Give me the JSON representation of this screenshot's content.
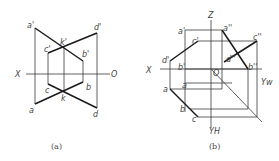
{
  "figure_a": {
    "caption": "(a)",
    "axis": {
      "x_label": "X",
      "o_label": "O"
    },
    "labels": {
      "a_prime": "a'",
      "b_prime": "b'",
      "c_prime": "c'",
      "d_prime": "d'",
      "k_prime": "k'",
      "a": "a",
      "b": "b",
      "c": "c",
      "d": "d",
      "k": "k"
    }
  },
  "figure_b": {
    "caption": "(b)",
    "axis": {
      "x_label": "X",
      "z_label": "Z",
      "o_label": "O",
      "yw_label": "Yw",
      "yh_label": "YH"
    },
    "labels": {
      "a_prime": "a'",
      "b_prime": "b'",
      "c_prime": "c'",
      "d_prime": "d'",
      "a_dprime": "a''",
      "b_dprime": "b''",
      "c_dprime": "c''",
      "d_dprime": "d''",
      "a": "a",
      "b": "b",
      "c": "c"
    }
  }
}
